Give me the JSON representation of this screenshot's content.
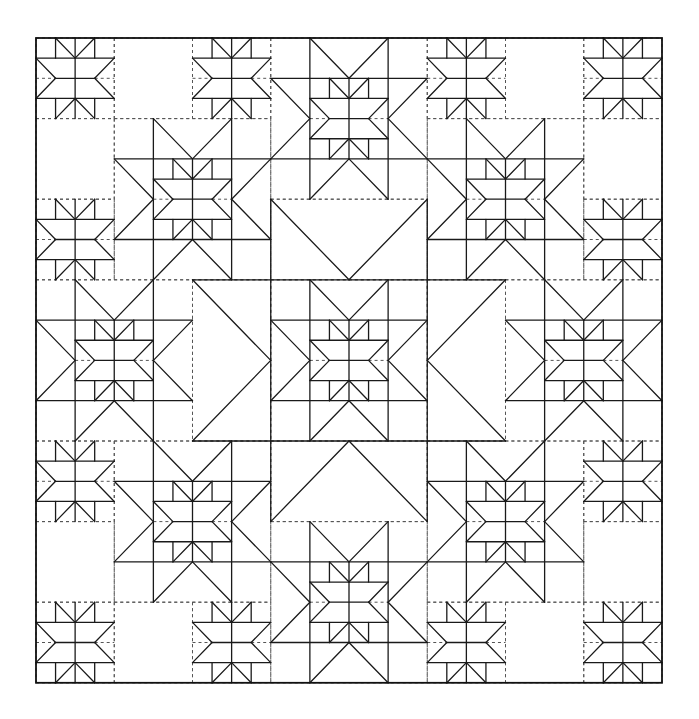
{
  "diagram": {
    "type": "quilt-pattern-line-drawing",
    "colors": {
      "line": "#1a1a1a",
      "dashed": "#555555",
      "background": "#ffffff"
    },
    "grid": {
      "units": 16,
      "origin_x": 36,
      "origin_y": 38,
      "unit_w": 39.125,
      "unit_h": 40.3
    },
    "medium_stars": [
      [
        8,
        2
      ],
      [
        4,
        4
      ],
      [
        12,
        4
      ],
      [
        2,
        8
      ],
      [
        8,
        8
      ],
      [
        14,
        8
      ],
      [
        4,
        12
      ],
      [
        12,
        12
      ],
      [
        8,
        14
      ]
    ],
    "small_stars": [
      [
        0,
        0
      ],
      [
        4,
        0
      ],
      [
        10,
        0
      ],
      [
        14,
        0
      ],
      [
        0,
        4
      ],
      [
        14,
        4
      ],
      [
        0,
        10
      ],
      [
        14,
        10
      ],
      [
        0,
        14
      ],
      [
        4,
        14
      ],
      [
        10,
        14
      ],
      [
        14,
        14
      ]
    ],
    "empty_blocks": [
      [
        2,
        0
      ],
      [
        12,
        0
      ],
      [
        0,
        2
      ],
      [
        14,
        2
      ],
      [
        0,
        12
      ],
      [
        14,
        12
      ],
      [
        2,
        14
      ],
      [
        12,
        14
      ]
    ],
    "large_triangles": [
      {
        "rect": [
          6,
          4,
          4,
          2
        ],
        "tri": [
          [
            6,
            4
          ],
          [
            8,
            6
          ],
          [
            10,
            4
          ]
        ]
      },
      {
        "rect": [
          6,
          10,
          4,
          2
        ],
        "tri": [
          [
            6,
            12
          ],
          [
            8,
            10
          ],
          [
            10,
            12
          ]
        ]
      },
      {
        "rect": [
          4,
          6,
          2,
          4
        ],
        "tri": [
          [
            4,
            6
          ],
          [
            6,
            8
          ],
          [
            4,
            10
          ]
        ]
      },
      {
        "rect": [
          10,
          6,
          2,
          4
        ],
        "tri": [
          [
            12,
            6
          ],
          [
            10,
            8
          ],
          [
            12,
            10
          ]
        ]
      }
    ]
  }
}
